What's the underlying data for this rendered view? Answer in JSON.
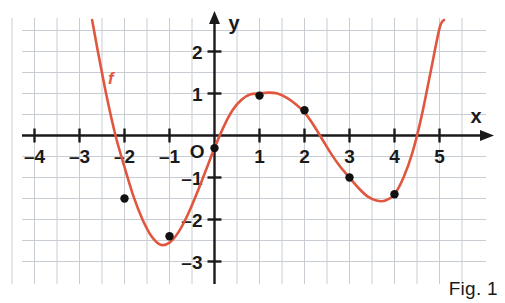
{
  "figure": {
    "caption": "Fig. 1",
    "curve_label": "f",
    "background_color": "#ffffff",
    "curve_color": "#E0563F",
    "grid_color": "#c8cdd4",
    "axis_color": "#1a1a1a",
    "point_color": "#111111"
  },
  "axes": {
    "x_axis_name": "x",
    "y_axis_name": "y",
    "origin_label": "O",
    "x_ticks": [
      {
        "value": -4,
        "label": "–4"
      },
      {
        "value": -3,
        "label": "–3"
      },
      {
        "value": -2,
        "label": "–2"
      },
      {
        "value": -1,
        "label": "–1"
      },
      {
        "value": 1,
        "label": "1"
      },
      {
        "value": 2,
        "label": "2"
      },
      {
        "value": 3,
        "label": "3"
      },
      {
        "value": 4,
        "label": "4"
      },
      {
        "value": 5,
        "label": "5"
      }
    ],
    "y_ticks": [
      {
        "value": 2,
        "label": "2"
      },
      {
        "value": 1,
        "label": "1"
      },
      {
        "value": -1,
        "label": "–1"
      },
      {
        "value": -2,
        "label": "–2"
      },
      {
        "value": -3,
        "label": "–3"
      }
    ]
  },
  "chart_data": {
    "type": "line",
    "title": "",
    "subtitle": "",
    "xlabel": "x",
    "ylabel": "y",
    "xlim": [
      -4.6,
      5.6
    ],
    "ylim": [
      -3.35,
      2.6
    ],
    "grid": true,
    "grid_step": 0.5,
    "legend": "f",
    "legend_position": "inline-left",
    "series": [
      {
        "name": "f",
        "color": "#E0563F",
        "x": [
          -2.72,
          -2.6,
          -2.4,
          -2.2,
          -2.0,
          -1.8,
          -1.6,
          -1.4,
          -1.2,
          -1.0,
          -0.8,
          -0.6,
          -0.4,
          -0.2,
          0.0,
          0.2,
          0.4,
          0.6,
          0.8,
          1.0,
          1.2,
          1.4,
          1.6,
          1.8,
          2.0,
          2.2,
          2.4,
          2.6,
          2.8,
          3.0,
          3.2,
          3.4,
          3.6,
          3.8,
          4.0,
          4.2,
          4.4,
          4.6,
          4.8,
          5.0,
          5.1
        ],
        "y": [
          2.75,
          2.05,
          0.95,
          0.0,
          -0.75,
          -1.45,
          -2.0,
          -2.4,
          -2.6,
          -2.55,
          -2.3,
          -1.9,
          -1.4,
          -0.85,
          -0.3,
          0.2,
          0.6,
          0.85,
          0.98,
          1.0,
          1.02,
          1.0,
          0.9,
          0.75,
          0.55,
          0.25,
          -0.1,
          -0.45,
          -0.75,
          -1.0,
          -1.25,
          -1.45,
          -1.55,
          -1.55,
          -1.4,
          -1.0,
          -0.4,
          0.45,
          1.5,
          2.55,
          2.75
        ]
      }
    ],
    "marked_points": [
      {
        "x": -2,
        "y": -1.5
      },
      {
        "x": -1,
        "y": -2.4
      },
      {
        "x": 0,
        "y": -0.3
      },
      {
        "x": 1,
        "y": 0.95
      },
      {
        "x": 2,
        "y": 0.6
      },
      {
        "x": 3,
        "y": -1.0
      },
      {
        "x": 4,
        "y": -1.4
      }
    ]
  }
}
